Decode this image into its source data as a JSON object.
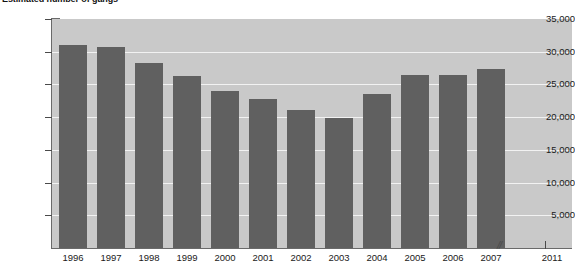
{
  "chart_data": {
    "type": "bar",
    "title": "Estimated number of gangs",
    "xlabel": "",
    "ylabel": "",
    "categories": [
      "1996",
      "1997",
      "1998",
      "1999",
      "2000",
      "2001",
      "2002",
      "2003",
      "2004",
      "2005",
      "2006",
      "2007",
      "2011"
    ],
    "values": [
      31000,
      30700,
      28300,
      26300,
      24000,
      22700,
      21100,
      19900,
      23600,
      26500,
      26500,
      27400,
      null
    ],
    "ylim": [
      0,
      35000
    ],
    "ytick_values": [
      5000,
      10000,
      15000,
      20000,
      25000,
      30000,
      35000
    ],
    "ytick_labels": [
      "5,000",
      "10,000",
      "15,000",
      "20,000",
      "25,000",
      "30,000",
      "35,000"
    ],
    "grid": true,
    "legend": "none",
    "axis_break_after": "2007",
    "axis_break_marker": "//",
    "bar_color": "#606060",
    "plot_background": "#c9c9c9",
    "gridline_color": "#f2f2f2",
    "axis_color": "#6a6a6a"
  }
}
